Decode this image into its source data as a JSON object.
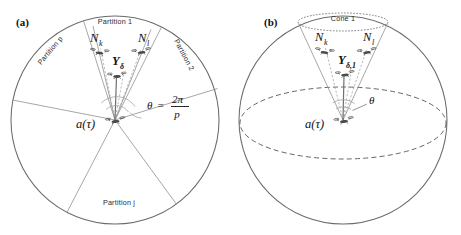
{
  "figure": {
    "width": 461,
    "height": 235,
    "background": "#ffffff",
    "line_color": "#6b6b6b",
    "text_color": "#222222"
  },
  "panels": [
    {
      "id": "panel-a",
      "label": "(a)",
      "type": "circle-partition",
      "center": {
        "x": 115,
        "y": 120
      },
      "radius": 104,
      "partitions": [
        {
          "name": "partition-1",
          "label": "Partition 1",
          "orientation": "horizontal"
        },
        {
          "name": "partition-2",
          "label": "Partition 2",
          "orientation": "rotated"
        },
        {
          "name": "partition-p",
          "label": "Partition p",
          "orientation": "rotated"
        },
        {
          "name": "partition-j",
          "label": "Partition j",
          "orientation": "horizontal"
        }
      ],
      "nodes": [
        {
          "name": "node-nk",
          "label": "N",
          "subscript": "k"
        },
        {
          "name": "node-nl",
          "label": "N",
          "subscript": "l"
        },
        {
          "name": "node-y-delta",
          "label": "Y",
          "subscript": "δ"
        },
        {
          "name": "node-agent",
          "label": "a(τ)"
        }
      ],
      "angle_annotation": {
        "name": "theta-equation",
        "theta": "θ",
        "equals": "=",
        "numerator": "2π",
        "denominator": "p"
      }
    },
    {
      "id": "panel-b",
      "label": "(b)",
      "type": "sphere-cone",
      "center": {
        "x": 343,
        "y": 120
      },
      "radius": 104,
      "cone_label": "Cone 1",
      "nodes": [
        {
          "name": "node-nk",
          "label": "N",
          "subscript": "k"
        },
        {
          "name": "node-nl",
          "label": "N",
          "subscript": "l"
        },
        {
          "name": "node-y-delta-1",
          "label": "Y",
          "subscript": "δ,1"
        },
        {
          "name": "node-agent",
          "label": "a(τ)"
        }
      ],
      "angle_annotation": {
        "name": "theta-symbol",
        "theta": "θ"
      }
    }
  ]
}
